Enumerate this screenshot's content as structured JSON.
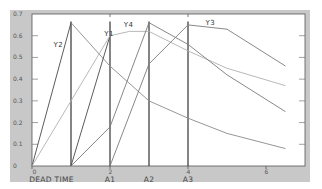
{
  "chart_data": {
    "type": "line",
    "title": "",
    "xlabel": "",
    "ylabel": "",
    "xlim": [
      0,
      7
    ],
    "ylim": [
      0,
      0.7
    ],
    "grid": false,
    "y_ticks": [
      "0",
      "0.1",
      "0.2",
      "0.3",
      "0.4",
      "0.5",
      "0.6",
      "0.7"
    ],
    "y_tick_values": [
      0,
      0.1,
      0.2,
      0.3,
      0.4,
      0.5,
      0.6,
      0.7
    ],
    "x_ticks": [
      "0",
      "2",
      "4",
      "6"
    ],
    "x_tick_values": [
      0,
      2,
      4,
      6
    ],
    "top_tick_values": [
      2,
      4
    ],
    "category_labels": [
      {
        "text": "DEAD TIME",
        "x": 0.5
      },
      {
        "text": "A1",
        "x": 2
      },
      {
        "text": "A2",
        "x": 3
      },
      {
        "text": "A3",
        "x": 4
      }
    ],
    "markers": [
      {
        "name": "dead-time-end",
        "x": 1
      },
      {
        "name": "A1",
        "x": 2
      },
      {
        "name": "A2",
        "x": 3
      },
      {
        "name": "A3",
        "x": 4
      }
    ],
    "series": [
      {
        "name": "Y2",
        "label_pos": [
          0.55,
          0.55
        ],
        "color": "#555555",
        "segments": [
          {
            "color": "#4a4a4a",
            "points": [
              [
                0,
                0
              ],
              [
                1,
                0.66
              ]
            ]
          },
          {
            "color": "#8a8a8a",
            "points": [
              [
                1,
                0.66
              ],
              [
                2,
                0.46
              ],
              [
                3,
                0.3
              ],
              [
                4,
                0.22
              ],
              [
                5,
                0.15
              ],
              [
                6.5,
                0.08
              ]
            ]
          }
        ]
      },
      {
        "name": "Y1",
        "label_pos": [
          1.85,
          0.6
        ],
        "color": "#4a4a4a",
        "segments": [
          {
            "color": "#4a4a4a",
            "points": [
              [
                1,
                0
              ],
              [
                2,
                0.6
              ]
            ]
          },
          {
            "color": "#b0b0b0",
            "points": [
              [
                0,
                0
              ],
              [
                1,
                0.3
              ],
              [
                2,
                0.6
              ],
              [
                2.5,
                0.62
              ],
              [
                3,
                0.62
              ],
              [
                4,
                0.53
              ],
              [
                5,
                0.45
              ],
              [
                6.5,
                0.37
              ]
            ]
          }
        ]
      },
      {
        "name": "Y4",
        "label_pos": [
          2.35,
          0.64
        ],
        "color": "#7a7a7a",
        "segments": [
          {
            "color": "#7a7a7a",
            "points": [
              [
                1,
                0
              ],
              [
                2,
                0.18
              ],
              [
                3,
                0.66
              ],
              [
                4,
                0.56
              ],
              [
                5,
                0.42
              ],
              [
                6.5,
                0.25
              ]
            ]
          }
        ]
      },
      {
        "name": "Y3",
        "label_pos": [
          4.45,
          0.65
        ],
        "color": "#7a7a7a",
        "segments": [
          {
            "color": "#7a7a7a",
            "points": [
              [
                2,
                0
              ],
              [
                3,
                0.47
              ],
              [
                4,
                0.65
              ],
              [
                5,
                0.63
              ],
              [
                6.5,
                0.46
              ]
            ]
          }
        ]
      }
    ]
  }
}
